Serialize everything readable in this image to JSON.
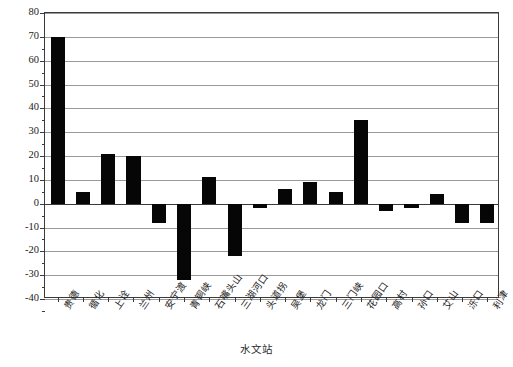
{
  "chart_data": {
    "type": "bar",
    "title": "",
    "xlabel": "水文站",
    "ylabel": "径流量比例/%",
    "ylim": [
      -40,
      80
    ],
    "ytick_step": 10,
    "grid": true,
    "legend": "none",
    "bar_color": "#060606",
    "categories": [
      "贵德",
      "循化",
      "上诠",
      "兰州",
      "安宁渡",
      "青铜峡",
      "石嘴头山",
      "三湖河口",
      "头道拐",
      "吴堡",
      "龙门",
      "三门峡",
      "花园口",
      "高村",
      "孙口",
      "艾山",
      "泺口",
      "利津"
    ],
    "values": [
      70,
      5,
      21,
      20,
      -8,
      -32,
      11,
      -22,
      -2,
      6,
      9,
      5,
      35,
      -3,
      -2,
      4,
      -8,
      -8
    ],
    "yticks": [
      -40,
      -30,
      -20,
      -10,
      0,
      10,
      20,
      30,
      40,
      50,
      60,
      70,
      80
    ],
    "ytick_labels": [
      "-40",
      "-30",
      "-20",
      "-10",
      "0",
      "10",
      "20",
      "30",
      "40",
      "50",
      "60",
      "70",
      "80"
    ]
  },
  "axis": {
    "y_title": "径流量比例/%",
    "x_title": "水文站"
  }
}
